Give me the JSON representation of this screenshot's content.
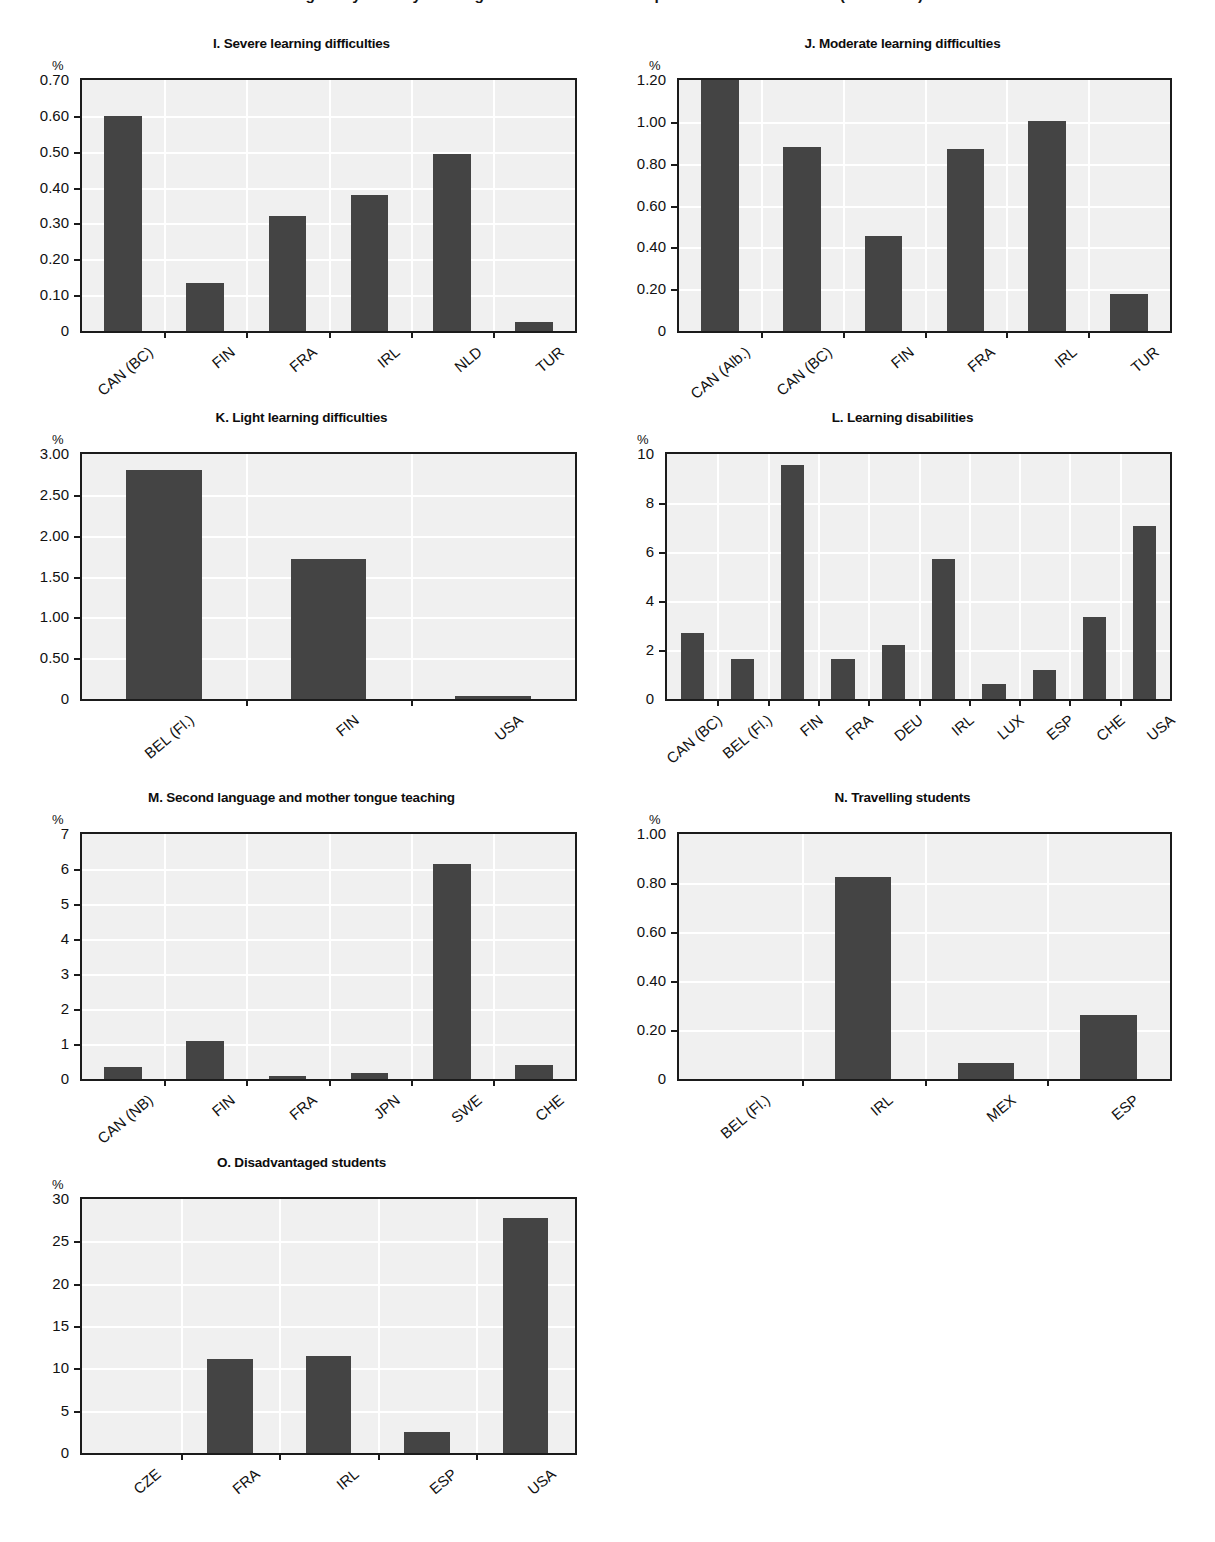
{
  "page": {
    "title_cut_off": "Figure by country of categories of students with special educational needs (continued)",
    "percent_symbol": "%"
  },
  "chart_data": [
    {
      "id": "I",
      "type": "bar",
      "title": "I. Severe learning difficulties",
      "ylabel": "%",
      "xlabel": "",
      "ylim": [
        0,
        0.7
      ],
      "ytick_labels": [
        "0",
        "0.10",
        "0.20",
        "0.30",
        "0.40",
        "0.50",
        "0.60",
        "0.70"
      ],
      "ytick_values": [
        0,
        0.1,
        0.2,
        0.3,
        0.4,
        0.5,
        0.6,
        0.7
      ],
      "grid": true,
      "legend": "none",
      "categories": [
        "CAN (BC)",
        "FIN",
        "FRA",
        "IRL",
        "NLD",
        "TUR"
      ],
      "values": [
        0.6,
        0.135,
        0.32,
        0.38,
        0.495,
        0.025
      ]
    },
    {
      "id": "J",
      "type": "bar",
      "title": "J. Moderate learning difficulties",
      "ylabel": "%",
      "xlabel": "",
      "ylim": [
        0,
        1.2
      ],
      "ytick_labels": [
        "0",
        "0.20",
        "0.40",
        "0.60",
        "0.80",
        "1.00",
        "1.20"
      ],
      "ytick_values": [
        0,
        0.2,
        0.4,
        0.6,
        0.8,
        1.0,
        1.2
      ],
      "grid": true,
      "legend": "none",
      "categories": [
        "CAN (Alb.)",
        "CAN (BC)",
        "FIN",
        "FRA",
        "IRL",
        "TUR"
      ],
      "values": [
        1.2,
        0.88,
        0.455,
        0.87,
        1.005,
        0.175
      ]
    },
    {
      "id": "K",
      "type": "bar",
      "title": "K. Light learning difficulties",
      "ylabel": "%",
      "xlabel": "",
      "ylim": [
        0,
        3.0
      ],
      "ytick_labels": [
        "0",
        "0.50",
        "1.00",
        "1.50",
        "2.00",
        "2.50",
        "3.00"
      ],
      "ytick_values": [
        0,
        0.5,
        1.0,
        1.5,
        2.0,
        2.5,
        3.0
      ],
      "grid": true,
      "legend": "none",
      "categories": [
        "BEL (Fl.)",
        "FIN",
        "USA"
      ],
      "values": [
        2.8,
        1.71,
        0.04
      ]
    },
    {
      "id": "L",
      "type": "bar",
      "title": "L. Learning disabilities",
      "ylabel": "%",
      "xlabel": "",
      "ylim": [
        0,
        10
      ],
      "ytick_labels": [
        "0",
        "2",
        "4",
        "6",
        "8",
        "10"
      ],
      "ytick_values": [
        0,
        2,
        4,
        6,
        8,
        10
      ],
      "grid": true,
      "legend": "none",
      "categories": [
        "CAN (BC)",
        "BEL (Fl.)",
        "FIN",
        "FRA",
        "DEU",
        "IRL",
        "LUX",
        "ESP",
        "CHE",
        "USA"
      ],
      "values": [
        2.7,
        1.65,
        9.55,
        1.65,
        2.2,
        5.7,
        0.6,
        1.2,
        3.35,
        7.05
      ]
    },
    {
      "id": "M",
      "type": "bar",
      "title": "M. Second language and mother tongue teaching",
      "ylabel": "%",
      "xlabel": "",
      "ylim": [
        0,
        7
      ],
      "ytick_labels": [
        "0",
        "1",
        "2",
        "3",
        "4",
        "5",
        "6",
        "7"
      ],
      "ytick_values": [
        0,
        1,
        2,
        3,
        4,
        5,
        6,
        7
      ],
      "grid": true,
      "legend": "none",
      "categories": [
        "CAN (NB)",
        "FIN",
        "FRA",
        "JPN",
        "SWE",
        "CHE"
      ],
      "values": [
        0.35,
        1.1,
        0.08,
        0.17,
        6.15,
        0.4
      ]
    },
    {
      "id": "N",
      "type": "bar",
      "title": "N. Travelling students",
      "ylabel": "%",
      "xlabel": "",
      "ylim": [
        0,
        1.0
      ],
      "ytick_labels": [
        "0",
        "0.20",
        "0.40",
        "0.60",
        "0.80",
        "1.00"
      ],
      "ytick_values": [
        0,
        0.2,
        0.4,
        0.6,
        0.8,
        1.0
      ],
      "grid": true,
      "legend": "none",
      "categories": [
        "BEL (Fl.)",
        "IRL",
        "MEX",
        "ESP"
      ],
      "values": [
        0,
        0.825,
        0.065,
        0.26
      ]
    },
    {
      "id": "O",
      "type": "bar",
      "title": "O.  Disadvantaged students",
      "ylabel": "%",
      "xlabel": "",
      "ylim": [
        0,
        30
      ],
      "ytick_labels": [
        "0",
        "5",
        "10",
        "15",
        "20",
        "25",
        "30"
      ],
      "ytick_values": [
        0,
        5,
        10,
        15,
        20,
        25,
        30
      ],
      "grid": true,
      "legend": "none",
      "categories": [
        "CZE",
        "FRA",
        "IRL",
        "ESP",
        "USA"
      ],
      "values": [
        0,
        11.1,
        11.5,
        2.5,
        27.8
      ]
    }
  ],
  "style": {
    "bar_color": "#444444",
    "plot_bg": "#f0f0f0",
    "gridline_color": "#ffffff",
    "axis_color": "#1b1b1b",
    "text_color": "#111111"
  },
  "layout": [
    {
      "id": "I",
      "left": 18,
      "top": 36,
      "plot_left": 62,
      "plot_top": 42,
      "plot_w": 497,
      "plot_h": 255
    },
    {
      "id": "J",
      "left": 625,
      "top": 36,
      "plot_left": 52,
      "plot_top": 42,
      "plot_w": 495,
      "plot_h": 255
    },
    {
      "id": "K",
      "left": 18,
      "top": 410,
      "plot_left": 62,
      "plot_top": 42,
      "plot_w": 497,
      "plot_h": 249
    },
    {
      "id": "L",
      "left": 625,
      "top": 410,
      "plot_left": 40,
      "plot_top": 42,
      "plot_w": 507,
      "plot_h": 249
    },
    {
      "id": "M",
      "left": 18,
      "top": 790,
      "plot_left": 62,
      "plot_top": 42,
      "plot_w": 497,
      "plot_h": 249
    },
    {
      "id": "N",
      "left": 625,
      "top": 790,
      "plot_left": 52,
      "plot_top": 42,
      "plot_w": 495,
      "plot_h": 249
    },
    {
      "id": "O",
      "left": 18,
      "top": 1155,
      "plot_left": 62,
      "plot_top": 42,
      "plot_w": 497,
      "plot_h": 258
    }
  ]
}
